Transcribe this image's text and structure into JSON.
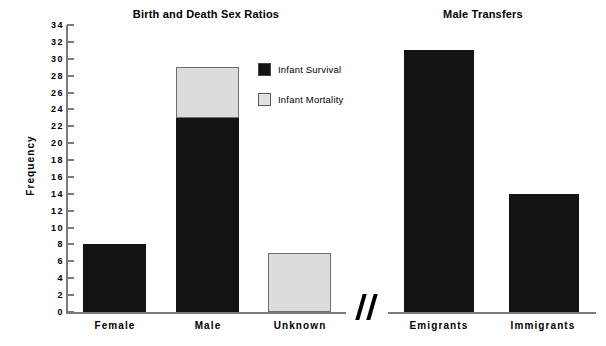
{
  "chart_data": {
    "type": "bar",
    "title": "Birth and Death Sex Ratios",
    "xlabel": "",
    "ylabel": "Frequency",
    "ylim": [
      0,
      34
    ],
    "ytick_step": 2,
    "yticks": [
      0,
      2,
      4,
      6,
      8,
      10,
      12,
      14,
      16,
      18,
      20,
      22,
      24,
      26,
      28,
      30,
      32,
      34
    ],
    "grid": false,
    "legend_position": "upper center-right",
    "stacked": true,
    "series": [
      {
        "name": "Infant  Survival",
        "color": "#131313",
        "values": [
          8,
          23,
          0,
          31,
          14
        ]
      },
      {
        "name": "Infant  Mortality",
        "color": "#dcdcdc",
        "values": [
          0,
          6,
          7,
          0,
          0
        ]
      }
    ],
    "categories": [
      "Female",
      "Male",
      "Unknown",
      "Emigrants",
      "Immigrants"
    ],
    "totals": [
      8,
      29,
      7,
      31,
      14
    ],
    "panels": [
      {
        "title": "Birth and Death Sex Ratios",
        "categories": [
          "Female",
          "Male",
          "Unknown"
        ],
        "bars": [
          {
            "label": "Female",
            "survival": 8,
            "mortality": 0,
            "total": 8
          },
          {
            "label": "Male",
            "survival": 23,
            "mortality": 6,
            "total": 29
          },
          {
            "label": "Unknown",
            "survival": 0,
            "mortality": 7,
            "total": 7
          }
        ]
      },
      {
        "title": "Male Transfers",
        "categories": [
          "Emigrants",
          "Immigrants"
        ],
        "bars": [
          {
            "label": "Emigrants",
            "survival": 31,
            "mortality": 0,
            "total": 31
          },
          {
            "label": "Immigrants",
            "survival": 14,
            "mortality": 0,
            "total": 14
          }
        ]
      }
    ],
    "annotations": [
      {
        "name": "axis-break",
        "symbol": "//"
      }
    ]
  },
  "titles": {
    "left": "Birth and Death Sex Ratios",
    "right": "Male Transfers"
  },
  "axes": {
    "y_label": "Frequency",
    "y_ticks": [
      "34",
      "32",
      "30",
      "28",
      "26",
      "24",
      "22",
      "20",
      "18",
      "16",
      "14",
      "12",
      "10",
      "8",
      "6",
      "4",
      "2",
      "0"
    ]
  },
  "legend": {
    "items": [
      {
        "label": "Infant  Survival",
        "color": "#131313"
      },
      {
        "label": "Infant  Mortality",
        "color": "#dcdcdc"
      }
    ]
  },
  "x_labels": {
    "female": "Female",
    "male": "Male",
    "unknown": "Unknown",
    "emigrants": "Emigrants",
    "immigrants": "Immigrants"
  }
}
